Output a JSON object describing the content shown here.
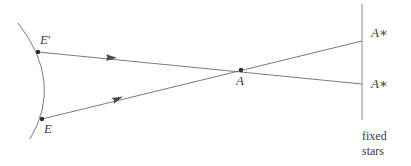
{
  "figure": {
    "stroke_color": "#6b6b6b",
    "text_color": "#3b3b3b",
    "background": "#ffffff",
    "labels": {
      "e_prime": "E",
      "e_prime_mark": "′",
      "e": "E",
      "a": "A",
      "a_star_top_letter": "A",
      "a_star_top_mark": "∗",
      "a_star_bottom_letter": "A",
      "a_star_bottom_mark": "∗",
      "fixed": "fixed",
      "stars": "stars"
    },
    "geometry": {
      "orbit_arc": {
        "start": [
          18,
          23
        ],
        "control": [
          64,
          82
        ],
        "end": [
          30,
          139
        ]
      },
      "point_e_prime": [
        38,
        52
      ],
      "point_e": [
        42,
        119
      ],
      "point_a": [
        241,
        70
      ],
      "sightline_upper": {
        "from": [
          38,
          52
        ],
        "to": [
          362,
          84
        ]
      },
      "sightline_lower": {
        "from": [
          42,
          119
        ],
        "to": [
          362,
          41
        ]
      },
      "arrow_upper": [
        112,
        57
      ],
      "arrow_lower": [
        118,
        98
      ],
      "star_plane_line": {
        "x": 362,
        "y1": 4,
        "y2": 120
      }
    }
  }
}
